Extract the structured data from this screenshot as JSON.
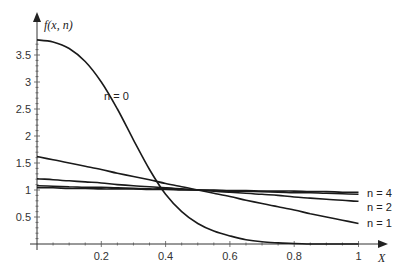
{
  "chart_data": {
    "type": "line",
    "title": "",
    "xlabel": "X",
    "ylabel": "f(x, n)",
    "xlim": [
      0,
      1
    ],
    "ylim": [
      0,
      3.9
    ],
    "grid": false,
    "legend_position": "inline-right",
    "x_ticks": [
      "0.2",
      "0.4",
      "0.6",
      "0.8",
      "1"
    ],
    "y_ticks": [
      "0.5",
      "1",
      "1.5",
      "2",
      "2.5",
      "3",
      "3.5"
    ],
    "x": [
      0,
      0.05,
      0.1,
      0.15,
      0.2,
      0.25,
      0.3,
      0.35,
      0.4,
      0.45,
      0.5,
      0.55,
      0.6,
      0.65,
      0.7,
      0.75,
      0.8,
      0.85,
      0.9,
      0.95,
      1.0
    ],
    "series": [
      {
        "name": "n = 0",
        "values": [
          3.78,
          3.74,
          3.62,
          3.38,
          3.0,
          2.5,
          1.93,
          1.38,
          0.92,
          0.6,
          0.38,
          0.24,
          0.15,
          0.08,
          0.04,
          0.02,
          0.01,
          0.0,
          0.0,
          0.0,
          0.0
        ]
      },
      {
        "name": "n = 1",
        "values": [
          1.62,
          1.56,
          1.5,
          1.44,
          1.38,
          1.31,
          1.25,
          1.19,
          1.12,
          1.06,
          1.0,
          0.94,
          0.88,
          0.81,
          0.75,
          0.69,
          0.63,
          0.56,
          0.5,
          0.44,
          0.38
        ]
      },
      {
        "name": "n = 2",
        "values": [
          1.21,
          1.19,
          1.17,
          1.15,
          1.13,
          1.1,
          1.08,
          1.06,
          1.04,
          1.02,
          1.0,
          0.98,
          0.96,
          0.94,
          0.92,
          0.9,
          0.87,
          0.85,
          0.83,
          0.81,
          0.79
        ]
      },
      {
        "name": "n = 3",
        "values": [
          1.08,
          1.07,
          1.06,
          1.05,
          1.05,
          1.04,
          1.03,
          1.02,
          1.02,
          1.01,
          1.0,
          0.99,
          0.98,
          0.98,
          0.97,
          0.96,
          0.95,
          0.95,
          0.94,
          0.93,
          0.92
        ]
      },
      {
        "name": "n = 4",
        "values": [
          1.04,
          1.04,
          1.03,
          1.03,
          1.02,
          1.02,
          1.02,
          1.01,
          1.01,
          1.0,
          1.0,
          1.0,
          0.99,
          0.99,
          0.98,
          0.98,
          0.98,
          0.97,
          0.97,
          0.96,
          0.96
        ]
      }
    ],
    "annotations": [
      {
        "text": "n = 0",
        "x": 0.3,
        "y": 2.65
      },
      {
        "text": "n = 4",
        "x": 1.03,
        "y": 0.96
      },
      {
        "text": "n = 2",
        "x": 1.03,
        "y": 0.7
      },
      {
        "text": "n = 1",
        "x": 1.03,
        "y": 0.4
      }
    ]
  },
  "labels": {
    "y_axis_title": "f(x, n)",
    "x_axis_title": "X",
    "curve_n0": "n = 0",
    "curve_n1": "n = 1",
    "curve_n2": "n = 2",
    "curve_n4": "n = 4"
  },
  "colors": {
    "line": "#1a1a1a",
    "axis": "#333333",
    "background": "#ffffff"
  }
}
